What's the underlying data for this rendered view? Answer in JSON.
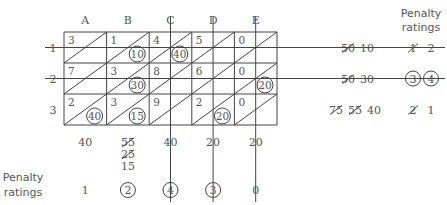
{
  "diagram": {
    "type": "transportation-table-vogel-approximation",
    "columns": [
      "A",
      "B",
      "C",
      "D",
      "E"
    ],
    "rows": [
      "1",
      "2",
      "3"
    ],
    "cells": [
      [
        {
          "cost": "3",
          "alloc": ""
        },
        {
          "cost": "1",
          "alloc": "10"
        },
        {
          "cost": "4",
          "alloc": "40"
        },
        {
          "cost": "5",
          "alloc": ""
        },
        {
          "cost": "0",
          "alloc": ""
        }
      ],
      [
        {
          "cost": "7",
          "alloc": ""
        },
        {
          "cost": "3",
          "alloc": "30"
        },
        {
          "cost": "8",
          "alloc": ""
        },
        {
          "cost": "6",
          "alloc": ""
        },
        {
          "cost": "0",
          "alloc": "20"
        }
      ],
      [
        {
          "cost": "2",
          "alloc": "40"
        },
        {
          "cost": "3",
          "alloc": "15"
        },
        {
          "cost": "9",
          "alloc": ""
        },
        {
          "cost": "2",
          "alloc": "20"
        },
        {
          "cost": "0",
          "alloc": ""
        }
      ]
    ],
    "crossed_rows": [
      0,
      1
    ],
    "crossed_columns": [
      2,
      3,
      4
    ],
    "supply": [
      {
        "values": [
          {
            "text": "50",
            "struck": true
          },
          {
            "text": "10",
            "struck": false
          }
        ]
      },
      {
        "values": [
          {
            "text": "50",
            "struck": true
          },
          {
            "text": "30",
            "struck": false
          }
        ]
      },
      {
        "values": [
          {
            "text": "75",
            "struck": true
          },
          {
            "text": "55",
            "struck": true
          },
          {
            "text": "40",
            "struck": false
          }
        ]
      }
    ],
    "row_penalties": [
      [
        {
          "text": "1",
          "struck": true,
          "circled": false
        },
        {
          "text": "2",
          "struck": false,
          "circled": false
        }
      ],
      [
        {
          "text": "3",
          "struck": false,
          "circled": true
        },
        {
          "text": "4",
          "struck": false,
          "circled": true
        }
      ],
      [
        {
          "text": "2",
          "struck": true,
          "circled": false
        },
        {
          "text": "1",
          "struck": false,
          "circled": false
        }
      ]
    ],
    "demand": [
      [
        {
          "text": "40",
          "struck": false
        }
      ],
      [
        {
          "text": "55",
          "struck": true
        },
        {
          "text": "25",
          "struck": true
        },
        {
          "text": "15",
          "struck": false
        }
      ],
      [
        {
          "text": "40",
          "struck": false
        }
      ],
      [
        {
          "text": "20",
          "struck": false
        }
      ],
      [
        {
          "text": "20",
          "struck": false
        }
      ]
    ],
    "column_penalties": [
      {
        "text": "1",
        "circled": false
      },
      {
        "text": "2",
        "circled": true
      },
      {
        "text": "4",
        "circled": true
      },
      {
        "text": "3",
        "circled": true
      },
      {
        "text": "0",
        "circled": false
      }
    ],
    "labels": {
      "penalty_header_line1": "Penalty",
      "penalty_header_line2": "ratings",
      "penalty_footer_line1": "Penalty",
      "penalty_footer_line2": "ratings"
    }
  }
}
